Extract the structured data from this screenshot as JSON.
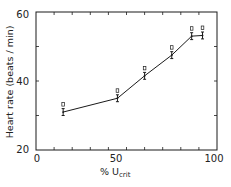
{
  "chart_data": {
    "type": "line",
    "title": "",
    "xlabel": "% U",
    "xlabel_subscript": "crit",
    "ylabel": "Heart rate (beats / min)",
    "xlim": [
      0,
      100
    ],
    "ylim": [
      20,
      60
    ],
    "x_ticks": [
      "0",
      "50",
      "100"
    ],
    "y_ticks": [
      "20",
      "40",
      "60"
    ],
    "x_minor_tick_step": 10,
    "y_minor_tick_step": 10,
    "grid": false,
    "legend": null,
    "series": [
      {
        "name": "Heart rate",
        "x": [
          15,
          45,
          60,
          75,
          86,
          92
        ],
        "values": [
          31,
          35,
          41.5,
          47.5,
          53,
          53.2
        ],
        "error": [
          1,
          1,
          1,
          1,
          1,
          1
        ]
      }
    ]
  },
  "labels": {
    "y_axis": "Heart rate (beats / min)",
    "x_axis_main": "% U",
    "x_axis_sub": "crit",
    "tick_x_0": "0",
    "tick_x_50": "50",
    "tick_x_100": "100",
    "tick_y_20": "20",
    "tick_y_40": "40",
    "tick_y_60": "60"
  },
  "colors": {
    "ink": "#1a1a1a",
    "background": "#ffffff"
  }
}
